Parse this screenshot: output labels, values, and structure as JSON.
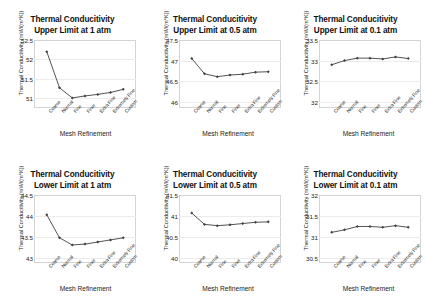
{
  "figure": {
    "panel_count": 6,
    "xlabel": "Mesh Refinement",
    "ylabel": "Thermal Conducitivity (mW/(m*K))",
    "series_color": "#404040",
    "plot_border_color": "#d4d4d4",
    "gridline_color": "#ececec",
    "x_tick_labels": [
      "Coarse",
      "Normal",
      "Fine",
      "Finer",
      "Extra Fine",
      "Extremely Fine",
      "Custom"
    ]
  },
  "chart_data": [
    {
      "type": "line",
      "title": "Thermal Conducitivity",
      "subtitle": "Upper Limit at 1 atm",
      "xlabel": "Mesh Refinement",
      "ylabel": "Thermal Conducitivity (mW/(m*K))",
      "categories": [
        "Coarse",
        "Normal",
        "Fine",
        "Finer",
        "Extra Fine",
        "Extremely Fine",
        "Custom"
      ],
      "values": [
        52.2,
        51.27,
        51.01,
        51.06,
        51.1,
        51.15,
        51.23
      ],
      "ylim": [
        50.75,
        52.5
      ],
      "yticks": [
        52.5,
        52,
        51.5,
        51
      ],
      "grid": true,
      "legend": "none"
    },
    {
      "type": "line",
      "title": "Thermal Conducitivity",
      "subtitle": "Upper Limit at 0.5 atm",
      "xlabel": "Mesh Refinement",
      "ylabel": "Thermal Conducitivity (mW/(m*K))",
      "categories": [
        "Coarse",
        "Normal",
        "Fine",
        "Finer",
        "Extra Fine",
        "Extremely Fine",
        "Custom"
      ],
      "values": [
        47.05,
        46.68,
        46.61,
        46.65,
        46.67,
        46.72,
        46.73
      ],
      "ylim": [
        45.85,
        47.5
      ],
      "yticks": [
        47.5,
        47,
        46.5,
        46
      ],
      "grid": true,
      "legend": "none"
    },
    {
      "type": "line",
      "title": "Thermal Conducitivity",
      "subtitle": "Upper Limit at 0.1 atm",
      "xlabel": "Mesh Refinement",
      "ylabel": "Thermal Conducitivity (mW/(m*K))",
      "categories": [
        "Coarse",
        "Normal",
        "Fine",
        "Finer",
        "Extra Fine",
        "Extremely Fine",
        "Custom"
      ],
      "values": [
        32.9,
        33.0,
        33.06,
        33.06,
        33.04,
        33.09,
        33.05
      ],
      "ylim": [
        31.85,
        33.5
      ],
      "yticks": [
        33.5,
        33,
        32.5,
        32
      ],
      "grid": true,
      "legend": "none"
    },
    {
      "type": "line",
      "title": "Thermal Conducitivity",
      "subtitle": "Lower Limit at 1 atm",
      "xlabel": "Mesh Refinement",
      "ylabel": "Thermal Conducitivity (mW/(m*K))",
      "categories": [
        "Coarse",
        "Normal",
        "Fine",
        "Finer",
        "Extra Fine",
        "Extremely Fine",
        "Custom"
      ],
      "values": [
        44.03,
        43.48,
        43.31,
        43.33,
        43.38,
        43.43,
        43.48
      ],
      "ylim": [
        42.88,
        44.5
      ],
      "yticks": [
        44.5,
        44,
        43.5,
        43
      ],
      "grid": true,
      "legend": "none"
    },
    {
      "type": "line",
      "title": "Thermal Conducitivity",
      "subtitle": "Lower Limit at 0.5 atm",
      "xlabel": "Mesh Refinement",
      "ylabel": "Thermal Conducitivity (mW/(m*K))",
      "categories": [
        "Coarse",
        "Normal",
        "Fine",
        "Finer",
        "Extra Fine",
        "Extremely Fine",
        "Custom"
      ],
      "values": [
        41.07,
        40.8,
        40.77,
        40.79,
        40.82,
        40.85,
        40.86
      ],
      "ylim": [
        39.88,
        41.5
      ],
      "yticks": [
        41.5,
        41,
        40.5,
        40
      ],
      "grid": true,
      "legend": "none"
    },
    {
      "type": "line",
      "title": "Thermal Conducitivity",
      "subtitle": "Lower Limit at 0.1 atm",
      "xlabel": "Mesh Refinement",
      "ylabel": "Thermal Conducitivity (mW/(m*K))",
      "categories": [
        "Coarse",
        "Normal",
        "Fine",
        "Finer",
        "Extra Fine",
        "Extremely Fine",
        "Custom"
      ],
      "values": [
        31.11,
        31.17,
        31.25,
        31.25,
        31.23,
        31.27,
        31.23
      ],
      "ylim": [
        30.38,
        32.0
      ],
      "yticks": [
        32,
        31.5,
        31,
        30.5
      ],
      "grid": true,
      "legend": "none"
    }
  ]
}
